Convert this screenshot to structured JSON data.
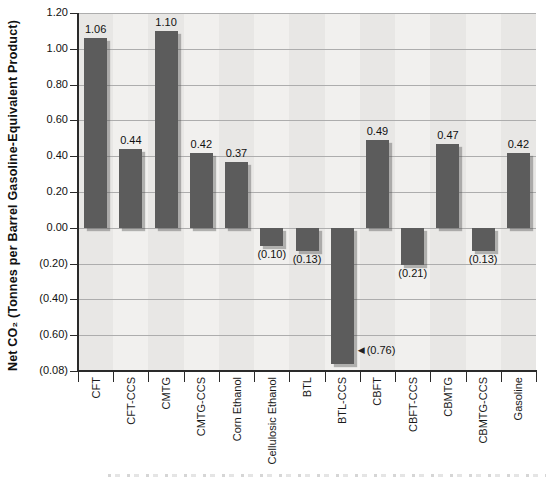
{
  "chart_data": {
    "type": "bar",
    "title": "",
    "xlabel": "",
    "ylabel": "Net CO₂ (Tonnes per Barrel Gasoline-Equivalent Product)",
    "categories": [
      "CFT",
      "CFT-CCS",
      "CMTG",
      "CMTG-CCS",
      "Corn Ethanol",
      "Cellulosic Ethanol",
      "BTL",
      "BTL-CCS",
      "CBFT",
      "CBFT-CCS",
      "CBMTG",
      "CBMTG-CCS",
      "Gasoline"
    ],
    "values": [
      1.06,
      0.44,
      1.1,
      0.42,
      0.37,
      -0.1,
      -0.13,
      -0.76,
      0.49,
      -0.21,
      0.47,
      -0.13,
      0.42
    ],
    "value_labels": [
      "1.06",
      "0.44",
      "1.10",
      "0.42",
      "0.37",
      "(0.10)",
      "(0.13)",
      "(0.76)",
      "0.49",
      "(0.21)",
      "0.47",
      "(0.13)",
      "0.42"
    ],
    "callout": {
      "category_index": 7,
      "arrow": "◀",
      "label": "(0.76)"
    },
    "ylim": [
      -0.8,
      1.2
    ],
    "y_tick_step": 0.2,
    "y_tick_labels": [
      "1.20",
      "1.00",
      "0.80",
      "0.60",
      "0.40",
      "0.20",
      "0.00",
      "(0.20)",
      "(0.40)",
      "(0.60)",
      "(0.08)"
    ],
    "grid": "horizontal",
    "legend": "none",
    "bar_color": "#5c5c5c",
    "band_color_even": "#e8e7e5",
    "band_color_odd": "#f1f0ee",
    "gridline_color": "#adadad",
    "axis_color": "#2a2a2a"
  }
}
